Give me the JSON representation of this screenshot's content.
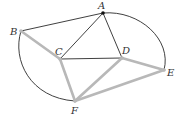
{
  "diagram": {
    "type": "graph",
    "colors": {
      "thin_edge": "#2a2a2a",
      "thick_edge": "#b8b8b8",
      "label": "#333333"
    },
    "nodes": [
      {
        "id": "A",
        "label": "A",
        "x": 103,
        "y": 13,
        "lx": 98,
        "ly": 9
      },
      {
        "id": "B",
        "label": "B",
        "x": 21,
        "y": 31,
        "lx": 10,
        "ly": 35
      },
      {
        "id": "C",
        "label": "C",
        "x": 60,
        "y": 59,
        "lx": 55,
        "ly": 55
      },
      {
        "id": "D",
        "label": "D",
        "x": 122,
        "y": 58,
        "lx": 122,
        "ly": 54
      },
      {
        "id": "E",
        "label": "E",
        "x": 164,
        "y": 70,
        "lx": 167,
        "ly": 76
      },
      {
        "id": "F",
        "label": "F",
        "x": 75,
        "y": 101,
        "lx": 71,
        "ly": 114
      }
    ],
    "thin_edges": [
      [
        "A",
        "B"
      ],
      [
        "A",
        "C"
      ],
      [
        "A",
        "D"
      ],
      [
        "C",
        "D"
      ]
    ],
    "arc_edges": [
      [
        "A",
        "E"
      ],
      [
        "B",
        "F"
      ]
    ],
    "thick_edges": [
      [
        "B",
        "C"
      ],
      [
        "C",
        "F"
      ],
      [
        "D",
        "F"
      ],
      [
        "D",
        "E"
      ],
      [
        "F",
        "E"
      ]
    ]
  }
}
